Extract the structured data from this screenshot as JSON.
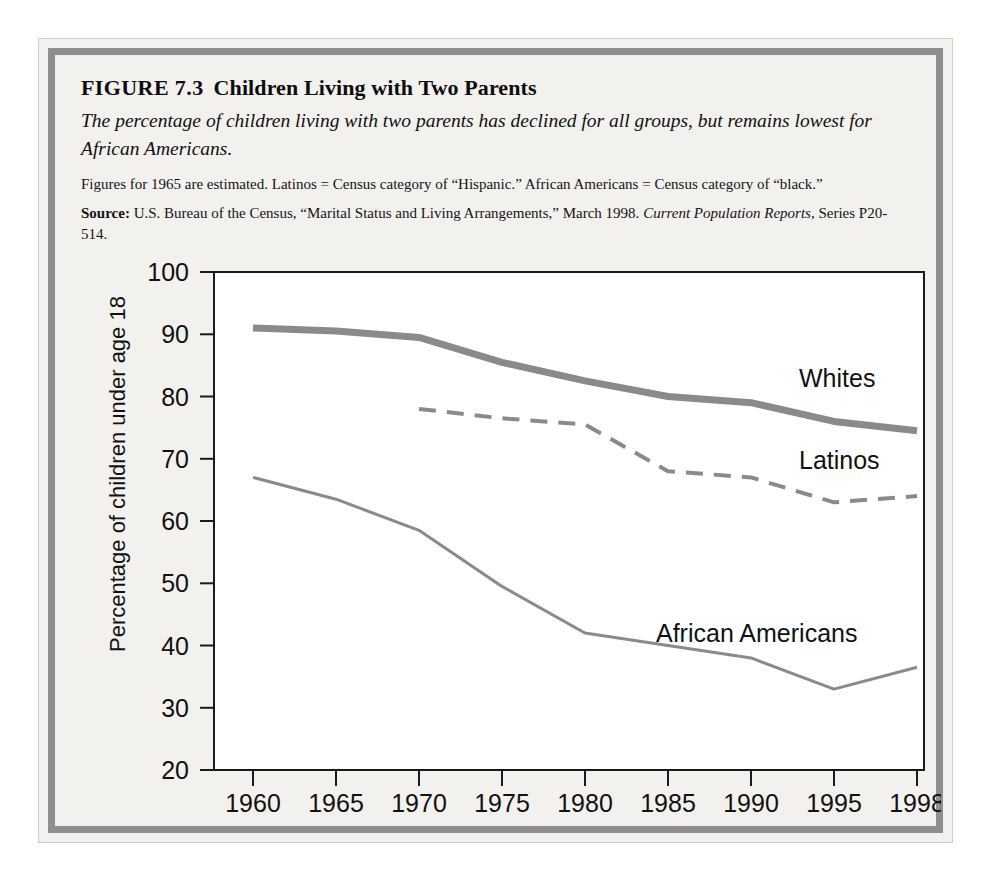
{
  "figure": {
    "label": "FIGURE 7.3",
    "name": "Children Living with Two Parents",
    "subtitle": "The percentage of children living with two parents has declined for all groups, but remains lowest for African Americans.",
    "note": "Figures for 1965 are estimated. Latinos = Census category of “Hispanic.” African Americans = Census category of “black.”",
    "source_lead": "Source:",
    "source_text": "U.S. Bureau of the Census, “Marital Status and Living Arrangements,” March 1998.",
    "source_italic": "Current Population Reports,",
    "source_tail": "Series P20-514."
  },
  "colors": {
    "frame_border": "#8e8e8e",
    "page_bg": "#f2f1ee",
    "plot_bg": "#ffffff",
    "axis": "#1a1a1a",
    "whites_line": "#8a8a8a",
    "latinos_line": "#8a8a8a",
    "african_americans_line": "#8a8a8a"
  },
  "chart_data": {
    "type": "line",
    "title": "Children Living with Two Parents",
    "xlabel": "",
    "ylabel": "Percentage of children under age 18",
    "x": [
      "1960",
      "1965",
      "1970",
      "1975",
      "1980",
      "1985",
      "1990",
      "1995",
      "1998"
    ],
    "xticklabels": [
      "1960",
      "1965",
      "1970",
      "1975",
      "1980",
      "1985",
      "1990",
      "1995",
      "1998"
    ],
    "yticklabels": [
      "20",
      "30",
      "40",
      "50",
      "60",
      "70",
      "80",
      "90",
      "100"
    ],
    "yticks": [
      20,
      30,
      40,
      50,
      60,
      70,
      80,
      90,
      100
    ],
    "ylim": [
      20,
      100
    ],
    "grid": false,
    "legend_position": "inline-right",
    "series": [
      {
        "name": "Whites",
        "style": "solid-thick",
        "color": "#8a8a8a",
        "x": [
          "1960",
          "1965",
          "1970",
          "1975",
          "1980",
          "1985",
          "1990",
          "1995",
          "1998"
        ],
        "values": [
          91.0,
          90.5,
          89.5,
          85.5,
          82.5,
          80.0,
          79.0,
          76.0,
          74.5
        ]
      },
      {
        "name": "Latinos",
        "style": "dashed",
        "color": "#8a8a8a",
        "x": [
          "1970",
          "1975",
          "1980",
          "1985",
          "1990",
          "1995",
          "1998"
        ],
        "values": [
          78.0,
          76.5,
          75.5,
          68.0,
          67.0,
          63.0,
          64.0
        ]
      },
      {
        "name": "African Americans",
        "style": "solid-thin",
        "color": "#8a8a8a",
        "x": [
          "1960",
          "1965",
          "1970",
          "1975",
          "1980",
          "1985",
          "1990",
          "1995",
          "1998"
        ],
        "values": [
          67.0,
          63.5,
          58.5,
          49.5,
          42.0,
          40.0,
          38.0,
          33.0,
          36.5
        ]
      }
    ],
    "annotations": [
      {
        "text": "Whites",
        "x": "1993",
        "y": 81.5
      },
      {
        "text": "Latinos",
        "x": "1993",
        "y": 69.5
      },
      {
        "text": "African Americans",
        "x": "1988",
        "y": 42.0
      }
    ]
  }
}
